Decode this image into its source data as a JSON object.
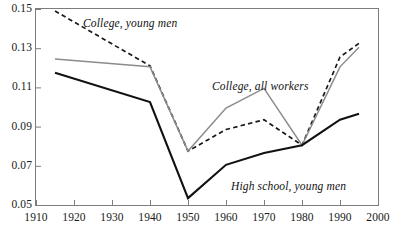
{
  "chart_data": {
    "type": "line",
    "title": "",
    "subtitle": "",
    "xlabel": "",
    "ylabel": "",
    "xlim": [
      1910,
      2000
    ],
    "ylim": [
      0.05,
      0.15
    ],
    "grid": false,
    "legend_position": "inline-annotations",
    "x_ticks": [
      1910,
      1920,
      1930,
      1940,
      1950,
      1960,
      1970,
      1980,
      1990,
      2000
    ],
    "x_tick_labels": [
      "1910",
      "1920",
      "1930",
      "1940",
      "1950",
      "1960",
      "1970",
      "1980",
      "1990",
      "2000"
    ],
    "y_ticks": [
      0.05,
      0.07,
      0.09,
      0.11,
      0.13,
      0.15
    ],
    "y_tick_labels": [
      "0.05",
      "0.07",
      "0.09",
      "0.11",
      "0.13",
      "0.15"
    ],
    "series": [
      {
        "name": "College, young men",
        "style": "dashed",
        "color": "#1a1a1a",
        "x": [
          1915,
          1940,
          1950,
          1960,
          1970,
          1980,
          1990,
          1995
        ],
        "values": [
          0.149,
          0.121,
          0.0775,
          0.0885,
          0.0935,
          0.0805,
          0.1255,
          0.1325
        ]
      },
      {
        "name": "College, all workers",
        "style": "solid",
        "color": "#8c8c8c",
        "x": [
          1915,
          1940,
          1950,
          1960,
          1970,
          1980,
          1990,
          1995
        ],
        "values": [
          0.1245,
          0.1205,
          0.0775,
          0.0995,
          0.1095,
          0.0805,
          0.1205,
          0.1305
        ]
      },
      {
        "name": "High school, young men",
        "style": "solid",
        "color": "#111111",
        "x": [
          1915,
          1940,
          1950,
          1960,
          1970,
          1980,
          1990,
          1995
        ],
        "values": [
          0.1175,
          0.1025,
          0.0535,
          0.0705,
          0.0765,
          0.0805,
          0.0935,
          0.0965
        ]
      }
    ],
    "annotations": [
      {
        "text": "College, young men",
        "x_px": 83,
        "y_px": 17
      },
      {
        "text": "College, all workers",
        "x_px": 212,
        "y_px": 80
      },
      {
        "text": "High school, young men",
        "x_px": 231,
        "y_px": 180
      }
    ]
  }
}
